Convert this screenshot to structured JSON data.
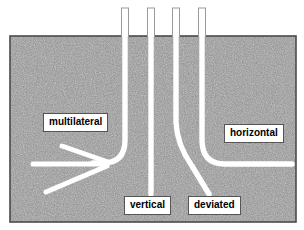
{
  "diagram": {
    "ground": {
      "fill_color": "#8c8c8c",
      "border_color": "#4a4a4a",
      "x": 10,
      "y": 36,
      "width": 286,
      "height": 186
    },
    "pipe": {
      "fill_color": "#ffffff",
      "outline_color": "#8a8a8a",
      "width_px": 5
    },
    "background_color": "#ffffff"
  },
  "labels": {
    "multilateral": "multilateral",
    "vertical": "vertical",
    "deviated": "deviated",
    "horizontal": "horizontal"
  },
  "wells": [
    {
      "name": "multilateral",
      "surface_x": 125,
      "description": "vertical section curving left into a horizontal lateral with three branch legs"
    },
    {
      "name": "vertical",
      "surface_x": 151,
      "description": "straight vertical borehole ending above the vertical label"
    },
    {
      "name": "deviated",
      "surface_x": 176,
      "description": "vertical section kicking off into a slanted deviated path"
    },
    {
      "name": "horizontal",
      "surface_x": 202,
      "description": "vertical section with a build curve into a long horizontal lateral"
    }
  ]
}
